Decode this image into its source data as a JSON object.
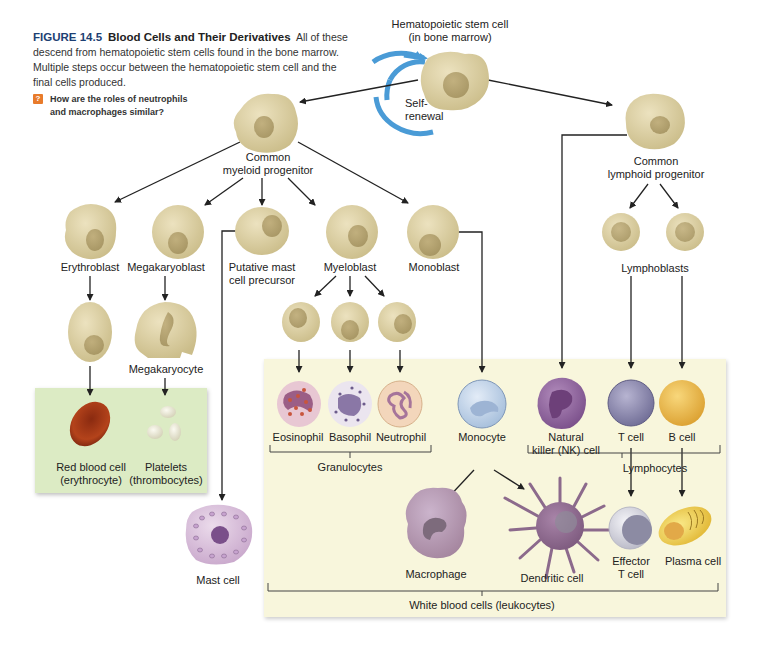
{
  "caption": {
    "figure_number": "FIGURE 14.5",
    "title": "Blood Cells and Their Derivatives",
    "body": "All of these descend from hematopoietic stem cells found in the bone marrow. Multiple steps occur between the hematopoietic stem cell and the final cells produced."
  },
  "question": {
    "icon": "question-mark-icon",
    "line1": "How are the roles of neutrophils",
    "line2": "and macrophages similar?"
  },
  "colors": {
    "figure_blue": "#1d3f73",
    "question_orange": "#e87b2b",
    "self_renewal_arrow": "#4a9bd6",
    "progenitor_tan": "#d9cc9f",
    "erythroid_panel_green": "#dcebc4",
    "leukocyte_panel_yellow": "#f8f6dc"
  },
  "nodes": {
    "stem_cell": {
      "line1": "Hematopoietic stem cell",
      "line2": "(in bone marrow)"
    },
    "self_renewal": {
      "line1": "Self-",
      "line2": "renewal"
    },
    "myeloid_progenitor": {
      "line1": "Common",
      "line2": "myeloid progenitor"
    },
    "lymphoid_progenitor": {
      "line1": "Common",
      "line2": "lymphoid progenitor"
    },
    "erythroblast": "Erythroblast",
    "megakaryoblast": "Megakaryoblast",
    "mast_precursor": {
      "line1": "Putative mast",
      "line2": "cell precursor"
    },
    "myeloblast": "Myeloblast",
    "monoblast": "Monoblast",
    "lymphoblasts": "Lymphoblasts",
    "megakaryocyte": "Megakaryocyte",
    "red_blood_cell": {
      "line1": "Red blood cell",
      "line2": "(erythrocyte)"
    },
    "platelets": {
      "line1": "Platelets",
      "line2": "(thrombocytes)"
    },
    "mast_cell": "Mast cell",
    "eosinophil": "Eosinophil",
    "basophil": "Basophil",
    "neutrophil": "Neutrophil",
    "monocyte": "Monocyte",
    "nk_cell": {
      "line1": "Natural",
      "line2": "killer (NK) cell"
    },
    "t_cell": "T cell",
    "b_cell": "B cell",
    "macrophage": "Macrophage",
    "dendritic_cell": "Dendritic cell",
    "effector_t_cell": {
      "line1": "Effector",
      "line2": "T cell"
    },
    "plasma_cell": "Plasma cell"
  },
  "groups": {
    "granulocytes": "Granulocytes",
    "lymphocytes": "Lymphocytes",
    "leukocytes": "White blood cells (leukocytes)"
  }
}
